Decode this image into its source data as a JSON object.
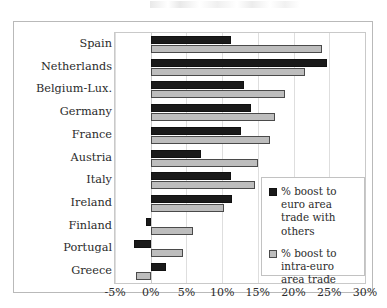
{
  "figure": {
    "background_color": "#ffffff",
    "frame_color": "#b9b9b9"
  },
  "chart_data": {
    "type": "bar",
    "orientation": "horizontal",
    "title": "",
    "subtitle": "",
    "xlabel": "",
    "ylabel": "",
    "xlim": [
      -5,
      30
    ],
    "xticks": [
      -5,
      0,
      5,
      10,
      15,
      20,
      25,
      30
    ],
    "xtick_labels": [
      "-5%",
      "0%",
      "5%",
      "10%",
      "15%",
      "20%",
      "25%",
      "30%"
    ],
    "grid": true,
    "grid_axis": "x",
    "legend_position": "center-right",
    "categories": [
      "Spain",
      "Netherlands",
      "Belgium-Lux.",
      "Germany",
      "France",
      "Austria",
      "Italy",
      "Ireland",
      "Finland",
      "Portugal",
      "Greece"
    ],
    "series": [
      {
        "name": "% boost to euro area trade with others",
        "color": "#1a1a1a",
        "values": [
          11.3,
          24.7,
          13.1,
          14.0,
          12.6,
          7.0,
          11.2,
          11.4,
          -0.6,
          -2.4,
          2.1
        ]
      },
      {
        "name": "% boost to intra-euro area trade",
        "color": "#bdbdbd",
        "values": [
          24.0,
          21.6,
          18.8,
          17.4,
          16.7,
          15.0,
          14.6,
          10.2,
          5.9,
          4.5,
          -2.0
        ]
      }
    ]
  },
  "legend": {
    "entries": [
      {
        "swatch": "dark-square-icon",
        "label": "% boost to euro area trade with others"
      },
      {
        "swatch": "light-square-icon",
        "label": "% boost to intra-euro area trade"
      }
    ]
  }
}
